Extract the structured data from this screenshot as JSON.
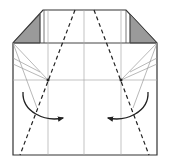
{
  "diagram": {
    "type": "origami-fold-step",
    "colors": {
      "background": "#ffffff",
      "outline": "#333333",
      "crease": "#aaaaaa",
      "valley_fold": "#222222",
      "shaded_flap": "#999999",
      "arrow": "#222222"
    },
    "paper": {
      "left": 13,
      "right": 157,
      "top_body": 43,
      "bottom": 155,
      "top_edge_y": 10,
      "top_left_x": 43,
      "top_right_x": 126
    },
    "flaps": [
      {
        "side": "left",
        "points": "13,43 40,43 40,14"
      },
      {
        "side": "right",
        "points": "157,43 130,43 130,14"
      }
    ],
    "grid_lines": {
      "verticals": [
        48,
        84,
        121
      ],
      "horizontals": [
        43,
        80
      ]
    },
    "valley_folds": [
      {
        "side": "left",
        "x1": 75,
        "y1": 10,
        "x2": 20,
        "y2": 155
      },
      {
        "side": "right",
        "x1": 94,
        "y1": 10,
        "x2": 149,
        "y2": 155
      }
    ],
    "reference_points": [
      {
        "side": "left",
        "x": 48,
        "y": 80
      },
      {
        "side": "right",
        "x": 121,
        "y": 80
      }
    ],
    "arrows": [
      {
        "side": "left",
        "direction": "fold-right",
        "path": "M23,92 C22,112 45,122 63,118"
      },
      {
        "side": "right",
        "direction": "fold-left",
        "path": "M148,92 C149,112 126,122 108,118"
      }
    ]
  }
}
